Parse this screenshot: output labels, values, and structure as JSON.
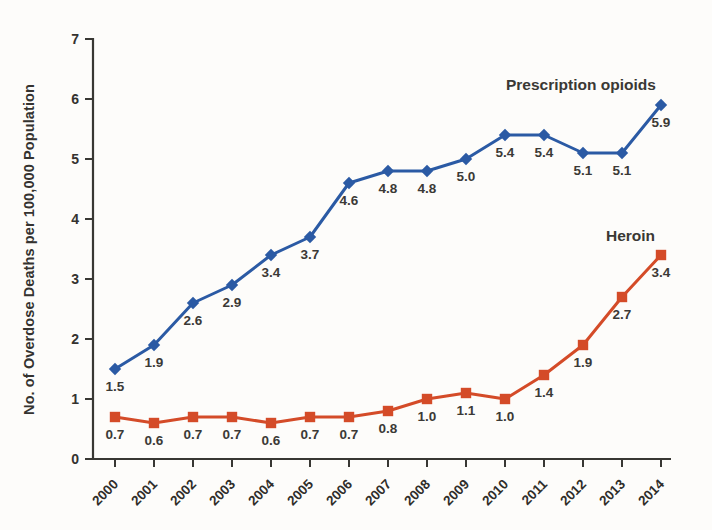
{
  "figure": {
    "background_color": "#fdfcfa"
  },
  "chart_data": {
    "type": "line",
    "title": "",
    "xlabel": "",
    "ylabel": "No. of Overdose Deaths per 100,000 Population",
    "ylim": [
      0,
      7
    ],
    "yticks": [
      0,
      1,
      2,
      3,
      4,
      5,
      6,
      7
    ],
    "grid": false,
    "legend_position": "inline-annotations",
    "axis_color": "#383733",
    "label_color": "#3b3936",
    "x": [
      "2000",
      "2001",
      "2002",
      "2003",
      "2004",
      "2005",
      "2006",
      "2007",
      "2008",
      "2009",
      "2010",
      "2011",
      "2012",
      "2013",
      "2014"
    ],
    "series": [
      {
        "name": "Prescription opioids",
        "color": "#2b5aa4",
        "marker": "diamond",
        "values": [
          1.5,
          1.9,
          2.6,
          2.9,
          3.4,
          3.7,
          4.6,
          4.8,
          4.8,
          5.0,
          5.4,
          5.4,
          5.1,
          5.1,
          5.9
        ]
      },
      {
        "name": "Heroin",
        "color": "#d44b28",
        "marker": "square",
        "values": [
          0.7,
          0.6,
          0.7,
          0.7,
          0.6,
          0.7,
          0.7,
          0.8,
          1.0,
          1.1,
          1.0,
          1.4,
          1.9,
          2.7,
          3.4
        ]
      }
    ]
  }
}
